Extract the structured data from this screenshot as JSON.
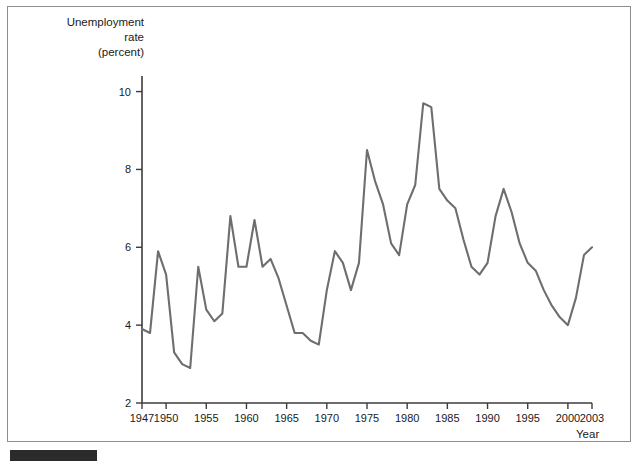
{
  "figure": {
    "y_axis_title": "Unemployment\nrate\n(percent)",
    "x_axis_title": "Year",
    "footer_bar_color": "#2b2b2b",
    "line_color": "#6e6e6e",
    "axis_color": "#3c3c3c",
    "background": "#ffffff"
  },
  "chart_data": {
    "type": "line",
    "title": "",
    "subtitle": "",
    "xlabel": "Year",
    "ylabel": "Unemployment rate (percent)",
    "xlim": [
      1947,
      2003
    ],
    "ylim": [
      2,
      10.4
    ],
    "grid": false,
    "legend": "none",
    "ytick_labels": [
      "2",
      "4",
      "6",
      "8",
      "10"
    ],
    "ytick_values": [
      2,
      4,
      6,
      8,
      10
    ],
    "xtick_labels": [
      "1947",
      "1950",
      "1955",
      "1960",
      "1965",
      "1970",
      "1975",
      "1980",
      "1985",
      "1990",
      "1995",
      "2000",
      "2003"
    ],
    "xtick_values": [
      1947,
      1950,
      1955,
      1960,
      1965,
      1970,
      1975,
      1980,
      1985,
      1990,
      1995,
      2000,
      2003
    ],
    "x": [
      1947,
      1948,
      1949,
      1950,
      1951,
      1952,
      1953,
      1954,
      1955,
      1956,
      1957,
      1958,
      1959,
      1960,
      1961,
      1962,
      1963,
      1964,
      1965,
      1966,
      1967,
      1968,
      1969,
      1970,
      1971,
      1972,
      1973,
      1974,
      1975,
      1976,
      1977,
      1978,
      1979,
      1980,
      1981,
      1982,
      1983,
      1984,
      1985,
      1986,
      1987,
      1988,
      1989,
      1990,
      1991,
      1992,
      1993,
      1994,
      1995,
      1996,
      1997,
      1998,
      1999,
      2000,
      2001,
      2002,
      2003
    ],
    "values": [
      3.9,
      3.8,
      5.9,
      5.3,
      3.3,
      3.0,
      2.9,
      5.5,
      4.4,
      4.1,
      4.3,
      6.8,
      5.5,
      5.5,
      6.7,
      5.5,
      5.7,
      5.2,
      4.5,
      3.8,
      3.8,
      3.6,
      3.5,
      4.9,
      5.9,
      5.6,
      4.9,
      5.6,
      8.5,
      7.7,
      7.1,
      6.1,
      5.8,
      7.1,
      7.6,
      9.7,
      9.6,
      7.5,
      7.2,
      7.0,
      6.2,
      5.5,
      5.3,
      5.6,
      6.8,
      7.5,
      6.9,
      6.1,
      5.6,
      5.4,
      4.9,
      4.5,
      4.2,
      4.0,
      4.7,
      5.8,
      6.0
    ]
  }
}
